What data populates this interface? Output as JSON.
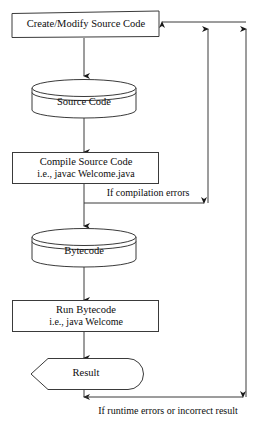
{
  "diagram": {
    "colors": {
      "stroke": "#3a3a3a",
      "text": "#0d0d0d",
      "background": "#ffffff"
    },
    "nodes": [
      {
        "id": "create-modify",
        "shape": "rectangle",
        "lines": [
          "Create/Modify Source Code"
        ]
      },
      {
        "id": "source-code",
        "shape": "cylinder",
        "lines": [
          "Source Code"
        ]
      },
      {
        "id": "compile",
        "shape": "rectangle",
        "lines": [
          "Compile Source Code",
          "i.e., javac Welcome.java"
        ]
      },
      {
        "id": "bytecode",
        "shape": "cylinder",
        "lines": [
          "Bytecode"
        ]
      },
      {
        "id": "run",
        "shape": "rectangle",
        "lines": [
          "Run Bytecode",
          "i.e., java Welcome"
        ]
      },
      {
        "id": "result",
        "shape": "chevron",
        "lines": [
          "Result"
        ]
      }
    ],
    "edge_labels": {
      "compilation_errors": "If compilation errors",
      "runtime_errors": "If runtime errors or incorrect result"
    }
  }
}
